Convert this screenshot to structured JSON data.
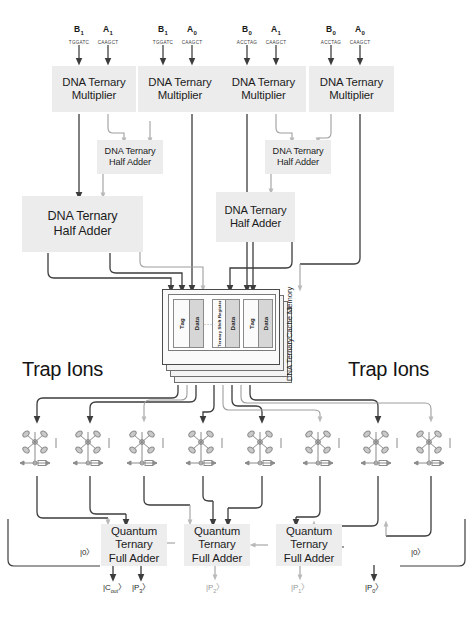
{
  "diagram": {
    "background_color": "#ffffff",
    "block_fill": "#ececed",
    "line_color_dark": "#3c3c3c",
    "line_color_light": "#b9b9b9"
  },
  "inputs": [
    {
      "symbol": "B",
      "subscript": "1",
      "sequence": "TGGATC"
    },
    {
      "symbol": "A",
      "subscript": "1",
      "sequence": "CAAGCT"
    },
    {
      "symbol": "B",
      "subscript": "1",
      "sequence": "TGGATC"
    },
    {
      "symbol": "A",
      "subscript": "0",
      "sequence": "CAAGCT"
    },
    {
      "symbol": "B",
      "subscript": "0",
      "sequence": "ACCTAG"
    },
    {
      "symbol": "A",
      "subscript": "1",
      "sequence": "CAAGCT"
    },
    {
      "symbol": "B",
      "subscript": "0",
      "sequence": "ACCTAG"
    },
    {
      "symbol": "A",
      "subscript": "0",
      "sequence": "CAAGCT"
    }
  ],
  "multipliers": [
    {
      "line1": "DNA Ternary",
      "line2": "Multiplier"
    },
    {
      "line1": "DNA Ternary",
      "line2": "Multiplier"
    },
    {
      "line1": "DNA Ternary",
      "line2": "Multiplier"
    },
    {
      "line1": "DNA Ternary",
      "line2": "Multiplier"
    }
  ],
  "half_adders": [
    {
      "line1": "DNA Ternary",
      "line2": "Half Adder",
      "size": "small"
    },
    {
      "line1": "DNA Ternary",
      "line2": "Half Adder",
      "size": "large"
    },
    {
      "line1": "DNA Ternary",
      "line2": "Half Adder",
      "size": "small"
    },
    {
      "line1": "DNA Ternary",
      "line2": "Half Adder",
      "size": "medium"
    }
  ],
  "cache_memory": {
    "title_line1": "DNA TernaryCache",
    "title_line2": "Memory",
    "cells": [
      {
        "label": "Tag",
        "kind": "tag"
      },
      {
        "label": "Data",
        "kind": "data"
      },
      {
        "label": "Tag",
        "kind": "tag"
      },
      {
        "label": "Data",
        "kind": "data"
      },
      {
        "label": "Tag",
        "kind": "tag"
      },
      {
        "label": "Data",
        "kind": "data"
      }
    ],
    "register_label": "Ternary Shift Register",
    "ellipsis": "...",
    "input_port_count": 8,
    "output_port_count": 8
  },
  "trap_ions": {
    "label_left": "Trap Ions",
    "label_right": "Trap Ions",
    "count": 8
  },
  "full_adders": [
    {
      "line1": "Quantum",
      "line2": "Ternary",
      "line3": "Full Adder"
    },
    {
      "line1": "Quantum",
      "line2": "Ternary",
      "line3": "Full Adder"
    },
    {
      "line1": "Quantum",
      "line2": "Ternary",
      "line3": "Full Adder"
    }
  ],
  "ancilla_inputs": [
    {
      "text": "|0〉"
    },
    {
      "text": "|0〉"
    }
  ],
  "outputs": [
    {
      "symbol": "|C",
      "subscript": "out",
      "close": "〉"
    },
    {
      "symbol": "|P",
      "subscript": "3",
      "close": "〉"
    },
    {
      "symbol": "|P",
      "subscript": "2",
      "close": "〉"
    },
    {
      "symbol": "|P",
      "subscript": "1",
      "close": "〉"
    },
    {
      "symbol": "|P",
      "subscript": "0",
      "close": "〉"
    }
  ]
}
